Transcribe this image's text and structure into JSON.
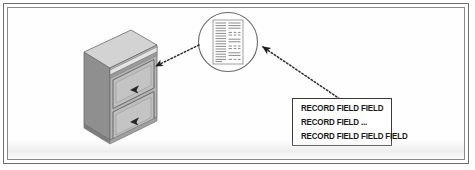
{
  "figure": {
    "width": 475,
    "height": 170,
    "background_color": "#ffffff",
    "frame_color": "#6e6e6e"
  },
  "cabinet": {
    "label": "filing-cabinet",
    "drawer_count": 2,
    "colors": {
      "top_face": "#d2d2d2",
      "front_face": "#b3b3b3",
      "side_face": "#8f8f8f",
      "drawer_face": "#bdbdbd",
      "handle": "#2b2b2b",
      "outline": "#6b6b6b"
    }
  },
  "magnifier": {
    "label": "magnified-document",
    "shape": "circle",
    "circle_color": "#6a6a6a",
    "document": {
      "page_color": "#ffffff",
      "line_color": "#8c8c8c",
      "left_column_lines": 14,
      "right_column_groups": 4
    }
  },
  "connectors": [
    {
      "name": "cabinet-connector",
      "style": "dotted",
      "arrow_at": "cabinet",
      "color": "#2e2e2e"
    },
    {
      "name": "record-connector",
      "style": "dotted",
      "arrow_at": "magnifier",
      "color": "#2e2e2e"
    }
  ],
  "record_box": {
    "name": "record-structure-box",
    "border_color": "#3a3a3a",
    "background_color": "#ffffff",
    "lines": [
      "RECORD FIELD FIELD",
      "RECORD FIELD ...",
      "RECORD FIELD FIELD FIELD"
    ]
  }
}
